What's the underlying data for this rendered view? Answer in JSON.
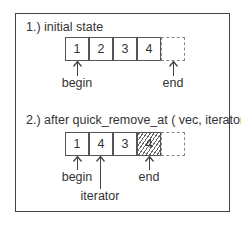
{
  "diagram": {
    "section1": {
      "title": "1.) initial state",
      "cells": [
        {
          "value": "1",
          "style": "solid"
        },
        {
          "value": "2",
          "style": "solid"
        },
        {
          "value": "3",
          "style": "solid"
        },
        {
          "value": "4",
          "style": "solid"
        },
        {
          "value": "",
          "style": "dashed"
        }
      ],
      "pointers": [
        {
          "label": "begin",
          "target_cell": 0
        },
        {
          "label": "end",
          "target_cell": 4
        }
      ]
    },
    "section2": {
      "title": "2.) after quick_remove_at ( vec, iterator )",
      "cells": [
        {
          "value": "1",
          "style": "solid"
        },
        {
          "value": "4",
          "style": "solid"
        },
        {
          "value": "3",
          "style": "solid"
        },
        {
          "value": "4",
          "style": "hatched"
        },
        {
          "value": "",
          "style": "dashed"
        }
      ],
      "pointers": [
        {
          "label": "begin",
          "target_cell": 0
        },
        {
          "label": "iterator",
          "target_cell": 1
        },
        {
          "label": "end",
          "target_cell": 3
        }
      ]
    }
  }
}
